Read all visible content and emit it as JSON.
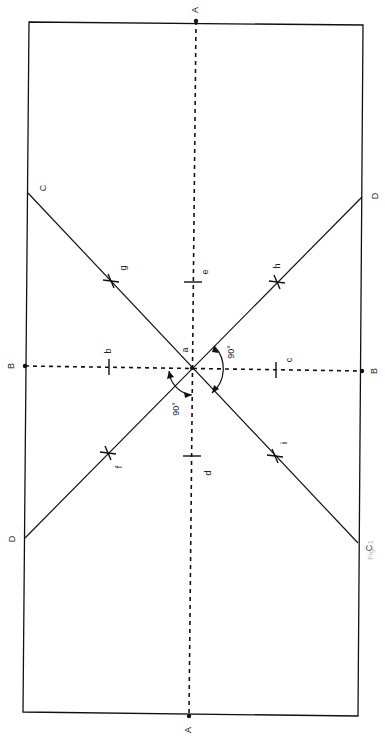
{
  "diagram": {
    "type": "geometric-construction",
    "stroke_color": "#111111",
    "outline": {
      "corners": [
        [
          29,
          22
        ],
        [
          363,
          25
        ],
        [
          358,
          716
        ],
        [
          23,
          712
        ]
      ]
    },
    "axes": [
      {
        "name": "A",
        "style": "dashed",
        "from": [
          196,
          21
        ],
        "to": [
          189,
          716
        ]
      },
      {
        "name": "B",
        "style": "dashed",
        "from": [
          25,
          366
        ],
        "to": [
          362,
          371
        ]
      }
    ],
    "diagonals": [
      {
        "name": "C-C",
        "from": [
          28,
          193
        ],
        "to": [
          358,
          543
        ]
      },
      {
        "name": "D-D",
        "from": [
          362,
          197
        ],
        "to": [
          25,
          538
        ]
      }
    ],
    "center": {
      "label": "a",
      "point": [
        192,
        368
      ]
    },
    "endpoints": [
      {
        "label": "A",
        "point": [
          196,
          21
        ],
        "text_pos": [
          196,
          10
        ]
      },
      {
        "label": "A",
        "point": [
          189,
          716
        ],
        "text_pos": [
          189,
          730
        ]
      },
      {
        "label": "B",
        "point": [
          25,
          366
        ],
        "text_pos": [
          12,
          366
        ]
      },
      {
        "label": "B",
        "point": [
          362,
          371
        ],
        "text_pos": [
          375,
          371
        ]
      },
      {
        "label": "C",
        "point": [
          28,
          193
        ],
        "text_pos": [
          44,
          188
        ]
      },
      {
        "label": "D",
        "point": [
          362,
          197
        ],
        "text_pos": [
          376,
          196
        ]
      },
      {
        "label": "D",
        "point": [
          25,
          538
        ],
        "text_pos": [
          13,
          539
        ]
      },
      {
        "label": "C",
        "point": [
          358,
          543
        ],
        "text_pos": [
          370,
          548
        ]
      }
    ],
    "tick_marks": [
      {
        "label": "e",
        "point": [
          193,
          282
        ],
        "orient": "h",
        "text_pos": [
          206,
          272
        ]
      },
      {
        "label": "d",
        "point": [
          192,
          456
        ],
        "orient": "h",
        "text_pos": [
          209,
          473
        ]
      },
      {
        "label": "b",
        "point": [
          109,
          367
        ],
        "orient": "v",
        "text_pos": [
          109,
          351
        ]
      },
      {
        "label": "c",
        "point": [
          276,
          370
        ],
        "orient": "v",
        "text_pos": [
          290,
          360
        ]
      }
    ],
    "cross_marks": [
      {
        "label": "g",
        "point": [
          111,
          281
        ],
        "text_pos": [
          124,
          268
        ]
      },
      {
        "label": "h",
        "point": [
          277,
          282
        ],
        "text_pos": [
          278,
          266
        ]
      },
      {
        "label": "f",
        "point": [
          108,
          453
        ],
        "text_pos": [
          120,
          467
        ]
      },
      {
        "label": "i",
        "point": [
          275,
          456
        ],
        "text_pos": [
          285,
          443
        ]
      }
    ],
    "angles": [
      {
        "label": "90°",
        "text_pos": [
          232,
          352
        ]
      },
      {
        "label": "90°",
        "text_pos": [
          177,
          409
        ]
      }
    ],
    "caption": "Fig. 1"
  }
}
